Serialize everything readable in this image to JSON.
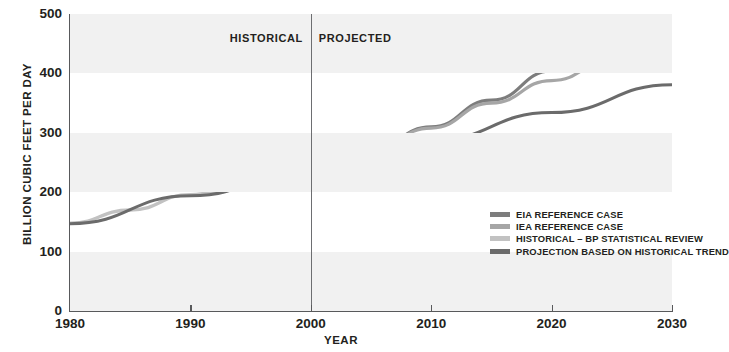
{
  "chart_data": {
    "type": "line",
    "title": "",
    "xlabel": "YEAR",
    "ylabel": "BILLION CUBIC FEET PER DAY",
    "xlim": [
      1980,
      2030
    ],
    "ylim": [
      0,
      500
    ],
    "grid": "horizontal-bands",
    "legend_position": "inside-center-right",
    "x_ticks": [
      1980,
      1990,
      2000,
      2010,
      2020,
      2030
    ],
    "y_ticks": [
      0,
      100,
      200,
      300,
      400,
      500
    ],
    "x_tick_labels": [
      "1980",
      "1990",
      "2000",
      "2010",
      "2020",
      "2030"
    ],
    "y_tick_labels": [
      "0",
      "100",
      "200",
      "300",
      "400",
      "500"
    ],
    "annotations": [
      {
        "name": "historical-region-label",
        "text": "HISTORICAL",
        "x": 2000,
        "align": "right"
      },
      {
        "name": "projected-region-label",
        "text": "PROJECTED",
        "x": 2000,
        "align": "left"
      },
      {
        "name": "era-divider",
        "text": "",
        "x": 2000
      }
    ],
    "series": [
      {
        "name": "EIA REFERENCE CASE",
        "color": "#7d7d7d",
        "x": [
          2000,
          2005,
          2010,
          2015,
          2020,
          2025,
          2030
        ],
        "values": [
          240,
          272,
          310,
          355,
          404,
          452,
          500
        ]
      },
      {
        "name": "IEA REFERENCE CASE",
        "color": "#a6a6a6",
        "x": [
          2000,
          2005,
          2010,
          2015,
          2020,
          2025,
          2030
        ],
        "values": [
          240,
          272,
          308,
          350,
          388,
          422,
          455
        ]
      },
      {
        "name": "HISTORICAL – BP STATISTICAL REVIEW",
        "color": "#c2c2c2",
        "x": [
          1980,
          1985,
          1990,
          1992,
          1995,
          2000
        ],
        "values": [
          148,
          170,
          196,
          199,
          214,
          240
        ]
      },
      {
        "name": "PROJECTION BASED ON HISTORICAL TREND",
        "color": "#6b6b6b",
        "x": [
          1980,
          1990,
          2000,
          2010,
          2020,
          2030
        ],
        "values": [
          147,
          194,
          240,
          287,
          334,
          381
        ]
      }
    ]
  },
  "axes": {
    "y_title": "BILLION CUBIC FEET PER DAY",
    "x_title": "YEAR"
  },
  "regions": {
    "historical_label": "HISTORICAL",
    "projected_label": "PROJECTED"
  },
  "legend": {
    "items": [
      {
        "label": "EIA REFERENCE CASE",
        "color": "#7d7d7d"
      },
      {
        "label": "IEA REFERENCE CASE",
        "color": "#a6a6a6"
      },
      {
        "label": "HISTORICAL – BP STATISTICAL REVIEW",
        "color": "#c2c2c2"
      },
      {
        "label": "PROJECTION BASED ON HISTORICAL TREND",
        "color": "#6b6b6b"
      }
    ]
  },
  "colors": {
    "band": "#f1f1f1",
    "axis": "#58595b",
    "text": "#231f20",
    "divider": "#6d6e71",
    "background": "#ffffff"
  }
}
